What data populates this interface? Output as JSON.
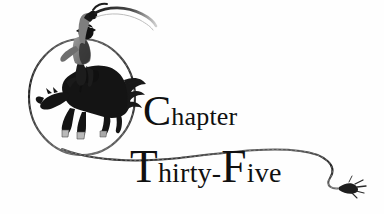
{
  "page": {
    "kind": "book-chapter-heading",
    "width": 384,
    "height": 214,
    "background_color": "#ffffff",
    "ink_color": "#101010"
  },
  "heading": {
    "line1": {
      "full_text": "Chapter",
      "initial": "C",
      "remainder": "hapter"
    },
    "line2": {
      "full_text": "Thirty-Five",
      "initial": "T",
      "remainder": "hirty-",
      "initial2": "F",
      "remainder2": "ive"
    }
  },
  "illustration": {
    "title": "bucking-bronco-rider-in-lasso",
    "elements": [
      "lasso-loop",
      "bucking-horse",
      "cowboy-rider",
      "raised-rope-arm",
      "trailing-rope",
      "rope-tassel-end"
    ],
    "colors": {
      "silhouette": "#141414",
      "rider_shirt": "#8a8a8a",
      "hooves": "#b9b9b9",
      "rope": "#2a2a2a",
      "rope_highlight": "#d8d8d8"
    }
  }
}
